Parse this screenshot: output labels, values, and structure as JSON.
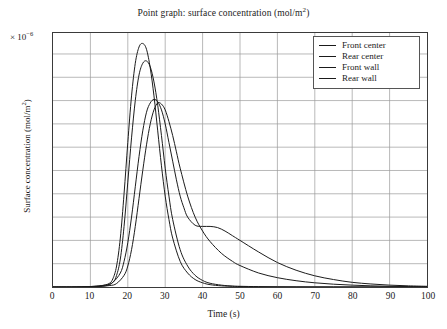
{
  "chart_data": {
    "type": "line",
    "xlabel": "Time (s)",
    "ylabel": "Surface concentration (mol/m²)",
    "y_multiplier": "× 10⁻⁶",
    "xlim": [
      0,
      100
    ],
    "ylim": [
      0,
      10.9
    ],
    "xticks": [
      0,
      10,
      20,
      30,
      40,
      50,
      60,
      70,
      80,
      90,
      100
    ],
    "yticks": [
      0,
      1,
      2,
      3,
      4,
      5,
      6,
      7,
      8,
      9,
      10
    ],
    "grid": true,
    "legend_position": "top-right",
    "line_color": "#1a1a1a",
    "series": [
      {
        "name": "Front center",
        "x": [
          0,
          5,
          10,
          13,
          15,
          16,
          17,
          18,
          19,
          20,
          21,
          22,
          23,
          24,
          25,
          26,
          27,
          28,
          29,
          30,
          31,
          32,
          34,
          36,
          38,
          40,
          42,
          45,
          48,
          50,
          55,
          60,
          65,
          70,
          75,
          80,
          85,
          90,
          95,
          100
        ],
        "y": [
          0,
          0,
          0.02,
          0.06,
          0.15,
          0.35,
          0.9,
          2.1,
          4.0,
          6.2,
          8.2,
          9.6,
          10.3,
          10.45,
          10.2,
          9.4,
          8.2,
          6.7,
          5.2,
          3.9,
          2.9,
          2.1,
          1.1,
          0.6,
          0.32,
          0.18,
          0.1,
          0.05,
          0.03,
          0.02,
          0.01,
          0.005,
          0.003,
          0.002,
          0.001,
          0.001,
          0,
          0,
          0,
          0
        ]
      },
      {
        "name": "Rear center",
        "x": [
          0,
          5,
          10,
          14,
          16,
          17,
          18,
          19,
          20,
          21,
          22,
          23,
          24,
          25,
          26,
          27,
          28,
          29,
          30,
          31,
          32,
          34,
          36,
          38,
          40,
          42,
          45,
          48,
          50,
          55,
          60,
          65,
          70,
          75,
          80,
          85,
          90,
          95,
          100
        ],
        "y": [
          0,
          0,
          0.01,
          0.05,
          0.2,
          0.5,
          1.2,
          2.6,
          4.5,
          6.4,
          8.0,
          9.1,
          9.6,
          9.7,
          9.45,
          8.8,
          7.8,
          6.5,
          5.1,
          3.9,
          2.9,
          1.6,
          0.9,
          0.5,
          0.28,
          0.16,
          0.08,
          0.04,
          0.03,
          0.015,
          0.008,
          0.005,
          0.003,
          0.002,
          0.001,
          0.001,
          0,
          0,
          0
        ]
      },
      {
        "name": "Front wall",
        "x": [
          0,
          5,
          10,
          14,
          16,
          18,
          19,
          20,
          21,
          22,
          23,
          24,
          25,
          26,
          27,
          28,
          29,
          30,
          31,
          32,
          33,
          34,
          35,
          36,
          38,
          40,
          42,
          44,
          46,
          48,
          50,
          55,
          60,
          65,
          70,
          75,
          80,
          85,
          90,
          95,
          100
        ],
        "y": [
          0,
          0,
          0.02,
          0.08,
          0.2,
          0.6,
          1.1,
          1.9,
          3.0,
          4.3,
          5.6,
          6.7,
          7.5,
          7.9,
          8.05,
          7.95,
          7.6,
          7.0,
          6.2,
          5.4,
          4.6,
          3.9,
          3.4,
          3.0,
          2.65,
          2.6,
          2.6,
          2.55,
          2.4,
          2.2,
          2.0,
          1.5,
          1.05,
          0.72,
          0.48,
          0.32,
          0.2,
          0.13,
          0.08,
          0.05,
          0.03
        ]
      },
      {
        "name": "Rear wall",
        "x": [
          0,
          5,
          10,
          15,
          17,
          19,
          20,
          21,
          22,
          23,
          24,
          25,
          26,
          27,
          28,
          29,
          30,
          31,
          32,
          33,
          34,
          36,
          38,
          40,
          42,
          45,
          48,
          50,
          55,
          60,
          65,
          70,
          75,
          80,
          85,
          90,
          95,
          100
        ],
        "y": [
          0,
          0,
          0.01,
          0.06,
          0.15,
          0.5,
          0.9,
          1.6,
          2.6,
          3.8,
          5.0,
          6.1,
          7.0,
          7.6,
          7.9,
          7.85,
          7.6,
          7.1,
          6.5,
          5.8,
          5.1,
          3.9,
          3.0,
          2.4,
          1.95,
          1.45,
          1.1,
          0.92,
          0.6,
          0.4,
          0.27,
          0.18,
          0.12,
          0.08,
          0.05,
          0.03,
          0.02,
          0.015
        ]
      }
    ]
  }
}
